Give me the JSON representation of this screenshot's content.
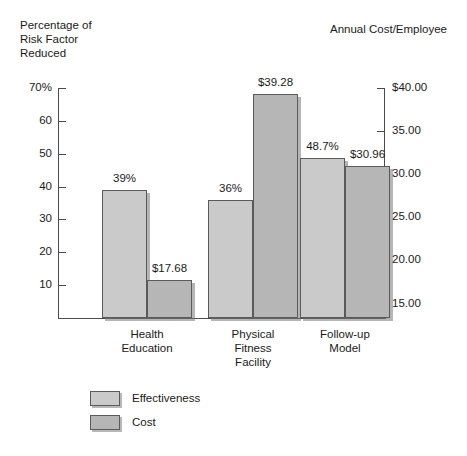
{
  "chart_data": {
    "type": "bar",
    "title": "",
    "categories": [
      "Health\nEducation",
      "Physical\nFitness\nFacility",
      "Follow-up\nModel"
    ],
    "series": [
      {
        "name": "Effectiveness",
        "axis": "left",
        "values": [
          39,
          36,
          48.7
        ],
        "data_labels": [
          "39%",
          "36%",
          "48.7%"
        ],
        "color": "#cacaca"
      },
      {
        "name": "Cost",
        "axis": "right",
        "values": [
          17.68,
          39.28,
          30.96
        ],
        "data_labels": [
          "$17.68",
          "$39.28",
          "$30.96"
        ],
        "color": "#b6b6b6"
      }
    ],
    "left_axis": {
      "label": "Percentage of\nRisk Factor\nReduced",
      "ticks": [
        "70%",
        "60",
        "50",
        "40",
        "30",
        "20",
        "10"
      ],
      "tick_values": [
        70,
        60,
        50,
        40,
        30,
        20,
        10
      ],
      "ylim": [
        0,
        70
      ]
    },
    "right_axis": {
      "label": "Annual Cost/Employee",
      "ticks": [
        "$40.00",
        "35.00",
        "30.00",
        "25.00",
        "20.00",
        "15.00"
      ],
      "tick_values": [
        40,
        35,
        30,
        25,
        20,
        15
      ],
      "ylim": [
        13.33,
        40
      ]
    },
    "grid": false,
    "legend_position": "bottom-left",
    "legend": [
      "Effectiveness",
      "Cost"
    ]
  }
}
